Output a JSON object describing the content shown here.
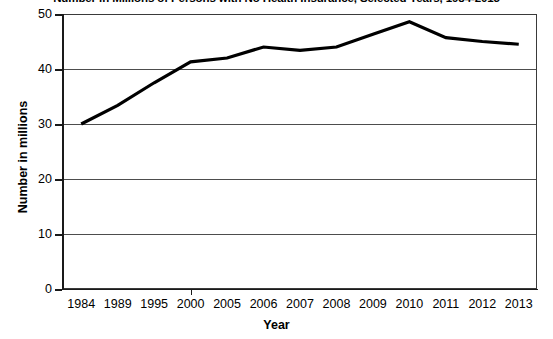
{
  "chart_data": {
    "type": "line",
    "title": "Number in Millions of Persons with No Health Insurance, Selected Years, 1984-2013",
    "xlabel": "Year",
    "ylabel": "Number in millions",
    "categories": [
      "1984",
      "1989",
      "1995",
      "2000",
      "2005",
      "2006",
      "2007",
      "2008",
      "2009",
      "2010",
      "2011",
      "2012",
      "2013"
    ],
    "values": [
      30.0,
      33.4,
      37.5,
      41.3,
      42.0,
      44.0,
      43.4,
      44.0,
      46.3,
      48.6,
      45.7,
      45.0,
      44.5
    ],
    "series": [
      {
        "name": "Persons with no health insurance",
        "values": [
          30.0,
          33.4,
          37.5,
          41.3,
          42.0,
          44.0,
          43.4,
          44.0,
          46.3,
          48.6,
          45.7,
          45.0,
          44.5
        ]
      }
    ],
    "ylim": [
      0,
      50
    ],
    "y_ticks": [
      0,
      10,
      20,
      30,
      40,
      50
    ],
    "grid": "horizontal",
    "legend": "none",
    "line_color": "#000000"
  },
  "axis": {
    "y_tick_labels": [
      "50",
      "40",
      "30",
      "20",
      "10",
      "0"
    ],
    "x_tick_labels": [
      "1984",
      "1989",
      "1995",
      "2000",
      "2005",
      "2006",
      "2007",
      "2008",
      "2009",
      "2010",
      "2011",
      "2012",
      "2013"
    ]
  }
}
